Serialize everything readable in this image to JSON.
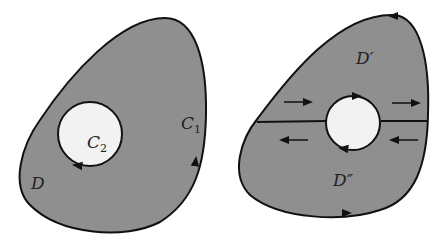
{
  "colors": {
    "region_fill": "#8f8f8f",
    "hole_fill": "#f2f2f2",
    "stroke": "#111111",
    "background": "#ffffff"
  },
  "left_figure": {
    "outer_curve_label": "C",
    "outer_curve_sub": "1",
    "inner_curve_label": "C",
    "inner_curve_sub": "2",
    "region_label": "D"
  },
  "right_figure": {
    "upper_region_label": "D′",
    "lower_region_label": "D″"
  }
}
